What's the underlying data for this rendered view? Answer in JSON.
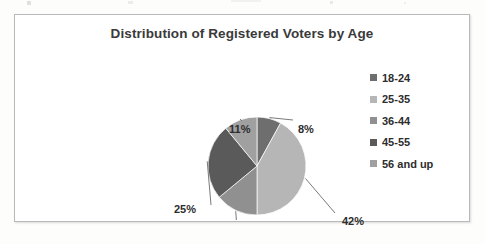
{
  "chart_data": {
    "type": "pie",
    "title": "Distribution of Registered Voters by Age",
    "xlabel": "",
    "ylabel": "",
    "legend_position": "right",
    "grid": false,
    "categories": [
      "18-24",
      "25-35",
      "36-44",
      "45-55",
      "56 and up"
    ],
    "values": [
      8,
      42,
      14,
      25,
      11
    ],
    "value_unit": "%",
    "data_labels": [
      "8%",
      "42%",
      "14%",
      "25%",
      "11%"
    ],
    "colors": [
      "#6e6e6e",
      "#b6b6b6",
      "#909090",
      "#5a5a5a",
      "#a0a0a0"
    ],
    "start_angle_deg": 0,
    "direction": "clockwise"
  },
  "chart": {
    "title": "Distribution of Registered Voters by Age"
  },
  "legend": {
    "items": [
      {
        "label": "18-24",
        "color": "#6e6e6e"
      },
      {
        "label": "25-35",
        "color": "#b6b6b6"
      },
      {
        "label": "36-44",
        "color": "#909090"
      },
      {
        "label": "45-55",
        "color": "#5a5a5a"
      },
      {
        "label": "56 and up",
        "color": "#a0a0a0"
      }
    ]
  },
  "labels": {
    "slice_0": "8%",
    "slice_1": "42%",
    "slice_2": "14%",
    "slice_3": "25%",
    "slice_4": "11%"
  }
}
